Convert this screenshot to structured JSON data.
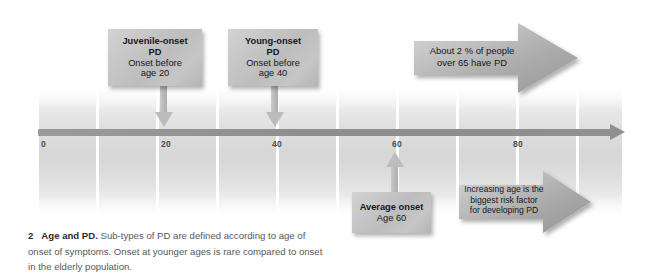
{
  "figure": {
    "caption_number": "2",
    "caption_title": "Age and PD.",
    "caption_text": " Sub-types of PD are defined according to age of onset of symptoms. Onset at younger ages is rare compared to onset in the elderly population."
  },
  "colors": {
    "band_mid": "#d6d6d6",
    "axis": "#8f8f8f",
    "sign_face": "#c5c5c5",
    "arrow_fill": "#a9a9a9",
    "text": "#16181c",
    "caption_text": "#58585c",
    "gridline": "#ffffff"
  },
  "timeline": {
    "axis_label": "age",
    "ticks": [
      {
        "value": "0",
        "x": 41
      },
      {
        "value": "20",
        "x": 161
      },
      {
        "value": "40",
        "x": 272
      },
      {
        "value": "60",
        "x": 392
      },
      {
        "value": "80",
        "x": 513
      }
    ],
    "gridlines_x": [
      36,
      96,
      156,
      216,
      276,
      336,
      396,
      456,
      516,
      576,
      622
    ]
  },
  "callouts": [
    {
      "id": "juvenile-onset",
      "line1": "Juvenile-onset",
      "line2": "PD",
      "line3": "Onset before",
      "line4": "age 20",
      "target_tick": "20"
    },
    {
      "id": "young-onset",
      "line1": "Young-onset",
      "line2": "PD",
      "line3": "Onset before",
      "line4": "age 40",
      "target_tick": "40"
    },
    {
      "id": "average-onset",
      "line1": "Average onset",
      "line2": "Age 60",
      "line3": "",
      "line4": "",
      "target_tick": "60"
    }
  ],
  "block_arrows": [
    {
      "id": "prevalence-over-65",
      "text": "About 2 % of people\nover 65 have PD"
    },
    {
      "id": "increasing-age-risk",
      "text": "Increasing age is the\nbiggest risk factor\nfor developing PD"
    }
  ]
}
